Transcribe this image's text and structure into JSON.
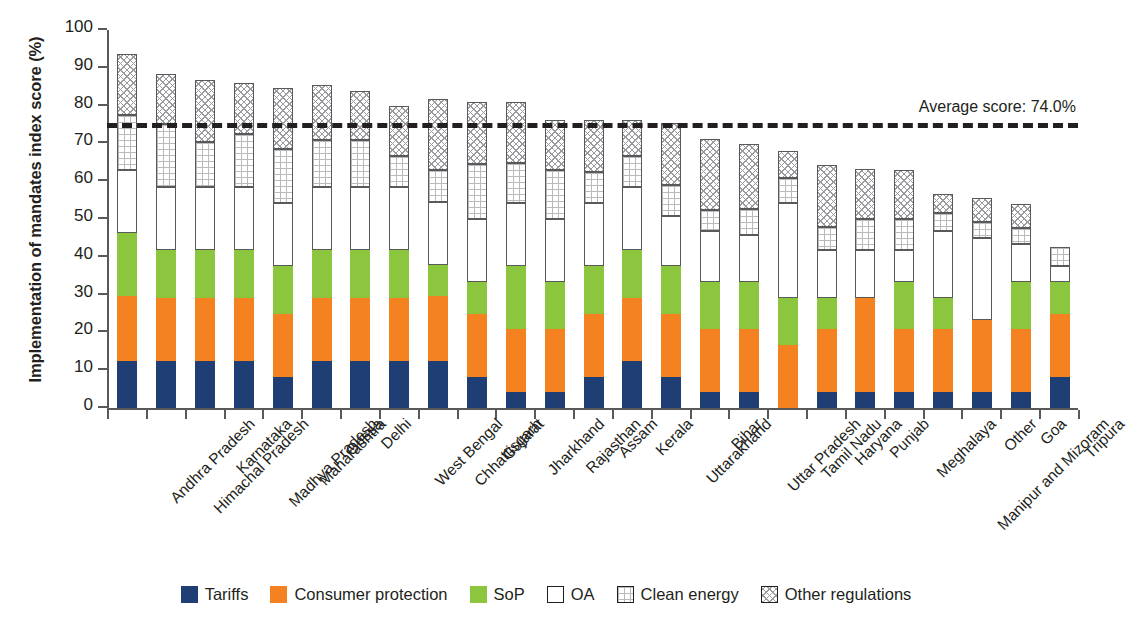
{
  "chart_data": {
    "type": "bar",
    "stacked": true,
    "title": "",
    "xlabel": "",
    "ylabel": "Implementation of mandates index score (%)",
    "ylim": [
      0,
      100
    ],
    "ytick_step": 10,
    "ytick_labels": [
      "0",
      "10",
      "20",
      "30",
      "40",
      "50",
      "60",
      "70",
      "80",
      "90",
      "100"
    ],
    "grid": false,
    "legend_position": "bottom",
    "categories": [
      "Andhra Pradesh",
      "Himachal Pradesh",
      "Karnataka",
      "Madhya Pradesh",
      "Maharashtra",
      "Orissa",
      "Delhi",
      "West Bengal",
      "Chhattisgarh",
      "Gujarat",
      "Jharkhand",
      "Rajasthan",
      "Assam",
      "Kerala",
      "Uttarakhand",
      "Bihar",
      "Uttar Pradesh",
      "Tamil Nadu",
      "Haryana",
      "Punjab",
      "Meghalaya",
      "Manipur and Mizoram",
      "Other",
      "Goa",
      "Tripura"
    ],
    "series": [
      {
        "name": "Tariffs",
        "color": "#1f3e74",
        "pattern": "solid",
        "values": [
          12.5,
          12.5,
          12.5,
          12.5,
          8.3,
          12.5,
          12.5,
          12.5,
          12.5,
          8.3,
          4.2,
          4.2,
          8.3,
          12.5,
          8.3,
          4.2,
          4.2,
          0.0,
          4.2,
          4.2,
          4.2,
          4.2,
          4.2,
          4.2,
          8.3
        ]
      },
      {
        "name": "Consumer protection",
        "color": "#f58220",
        "pattern": "solid",
        "values": [
          17.1,
          16.7,
          16.7,
          16.7,
          16.7,
          16.7,
          16.7,
          16.7,
          17.1,
          16.7,
          16.7,
          16.7,
          16.7,
          16.7,
          16.7,
          16.7,
          16.7,
          16.7,
          16.7,
          25.0,
          16.7,
          16.7,
          19.2,
          16.7,
          16.7
        ]
      },
      {
        "name": "SoP",
        "color": "#8cc63e",
        "pattern": "solid",
        "values": [
          16.7,
          12.5,
          12.5,
          12.5,
          12.5,
          12.5,
          12.5,
          12.5,
          8.3,
          8.3,
          16.7,
          12.5,
          12.5,
          12.5,
          12.5,
          12.5,
          12.5,
          12.5,
          8.3,
          0.0,
          12.5,
          8.3,
          0.0,
          12.5,
          8.3
        ]
      },
      {
        "name": "OA",
        "color": "#ffffff",
        "pattern": "open",
        "values": [
          16.7,
          16.7,
          16.7,
          16.7,
          16.7,
          16.7,
          16.7,
          16.7,
          16.7,
          16.7,
          16.7,
          16.7,
          16.7,
          16.7,
          13.3,
          13.3,
          12.5,
          25.0,
          12.5,
          12.5,
          8.3,
          17.5,
          21.7,
          10.0,
          4.2
        ]
      },
      {
        "name": "Clean energy",
        "color": "#ffffff",
        "pattern": "grid",
        "values": [
          14.6,
          16.7,
          12.1,
          14.2,
          14.2,
          12.5,
          12.5,
          8.3,
          8.3,
          14.6,
          10.4,
          12.9,
          8.3,
          8.3,
          8.3,
          5.8,
          6.7,
          6.7,
          6.3,
          8.3,
          8.3,
          5.0,
          4.2,
          4.2,
          5.0
        ]
      },
      {
        "name": "Other regulations",
        "color": "#ffffff",
        "pattern": "hatch",
        "values": [
          16.1,
          13.3,
          16.3,
          13.3,
          16.3,
          14.6,
          12.9,
          13.3,
          18.8,
          16.3,
          16.3,
          13.3,
          13.8,
          9.6,
          16.3,
          18.8,
          17.3,
          7.1,
          16.3,
          13.3,
          12.9,
          5.0,
          6.3,
          6.3,
          0.0
        ]
      }
    ],
    "annotations": [
      {
        "name": "average-line",
        "label": "Average score: 74.0%",
        "value": 74.0,
        "style": "dashed",
        "color": "#231f20"
      }
    ]
  },
  "legend": {
    "items": [
      {
        "label": "Tariffs",
        "swatch": "tariffs"
      },
      {
        "label": "Consumer protection",
        "swatch": "consumer"
      },
      {
        "label": "SoP",
        "swatch": "sop"
      },
      {
        "label": "OA",
        "swatch": "oa"
      },
      {
        "label": "Clean energy",
        "swatch": "clean"
      },
      {
        "label": "Other regulations",
        "swatch": "other"
      }
    ]
  }
}
